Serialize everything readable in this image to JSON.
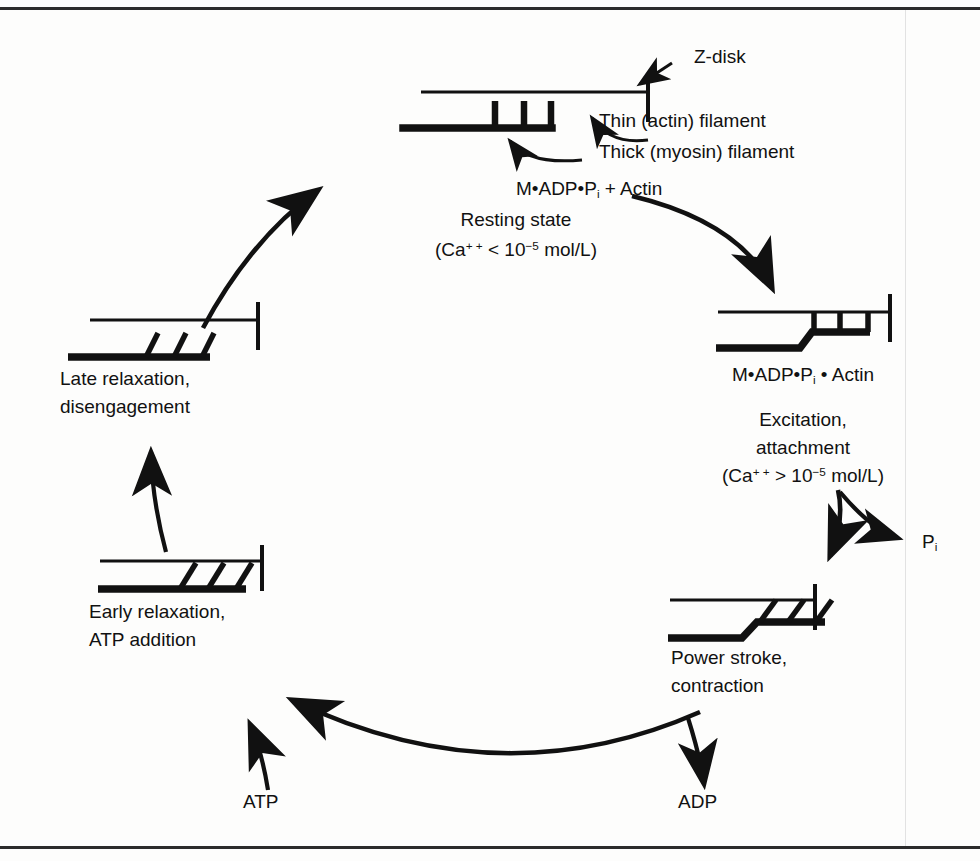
{
  "diagram": {
    "ink_color": "#111111",
    "background_color": "#fdfdfc",
    "annotations": {
      "z_disk": "Z-disk",
      "thin_filament": "Thin (actin) filament",
      "thick_filament": "Thick (myosin) filament"
    },
    "stages": [
      {
        "id": "resting",
        "formula_prefix": "M•ADP•P",
        "formula_sub": "i",
        "formula_suffix": "  +  Actin",
        "name_line1": "Resting state",
        "condition_prefix": "(Ca",
        "condition_sup1": "+ +",
        "condition_mid": "  <  10",
        "condition_sup2": "−5",
        "condition_suffix": " mol/L)"
      },
      {
        "id": "excitation",
        "formula_prefix": "M•ADP•P",
        "formula_sub": "i",
        "formula_suffix": " • Actin",
        "name_line1": "Excitation,",
        "name_line2": "attachment",
        "condition_prefix": "(Ca",
        "condition_sup1": "+ +",
        "condition_mid": "  >  10",
        "condition_sup2": "−5",
        "condition_suffix": " mol/L)"
      },
      {
        "id": "power-stroke",
        "name_line1": "Power stroke,",
        "name_line2": "contraction"
      },
      {
        "id": "early-relaxation",
        "name_line1": "Early relaxation,",
        "name_line2": "ATP addition"
      },
      {
        "id": "late-relaxation",
        "name_line1": "Late relaxation,",
        "name_line2": "disengagement"
      }
    ],
    "molecules": {
      "phosphate_symbol": "P",
      "phosphate_sub": "i",
      "atp": "ATP",
      "adp": "ADP"
    }
  }
}
